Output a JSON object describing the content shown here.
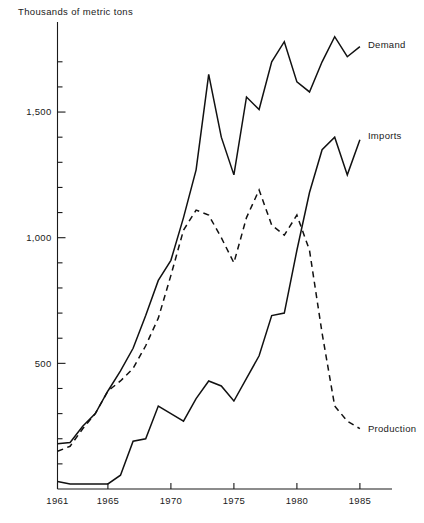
{
  "chart_data": {
    "type": "line",
    "title": "",
    "ylabel": "Thousands of metric tons",
    "xlabel": "",
    "xlim": [
      1961,
      1986.5
    ],
    "ylim": [
      0,
      1800
    ],
    "grid": false,
    "legend_position": "inline-right-end-of-line",
    "y_major_ticks": [
      500,
      1000,
      1500
    ],
    "y_major_tick_labels": [
      "500",
      "1,000",
      "1,500"
    ],
    "y_minor_tick_step": 100,
    "x_ticks": [
      1961,
      1965,
      1970,
      1975,
      1980,
      1985
    ],
    "x_tick_labels": [
      "1961",
      "1965",
      "1970",
      "1975",
      "1980",
      "1985"
    ],
    "x": [
      1961,
      1962,
      1963,
      1964,
      1965,
      1966,
      1967,
      1968,
      1969,
      1970,
      1971,
      1972,
      1973,
      1974,
      1975,
      1976,
      1977,
      1978,
      1979,
      1980,
      1981,
      1982,
      1983,
      1984,
      1985
    ],
    "series": [
      {
        "name": "Demand",
        "style": "solid",
        "values": [
          180,
          185,
          250,
          300,
          390,
          470,
          560,
          690,
          830,
          910,
          1080,
          1270,
          1650,
          1400,
          1250,
          1560,
          1510,
          1700,
          1780,
          1620,
          1580,
          1700,
          1800,
          1720,
          1760
        ]
      },
      {
        "name": "Imports",
        "style": "solid",
        "values": [
          30,
          20,
          20,
          20,
          20,
          55,
          190,
          200,
          330,
          300,
          270,
          360,
          430,
          410,
          350,
          440,
          530,
          690,
          700,
          950,
          1180,
          1350,
          1400,
          1250,
          1390
        ]
      },
      {
        "name": "Production",
        "style": "dashed",
        "values": [
          150,
          170,
          240,
          300,
          390,
          430,
          480,
          570,
          680,
          850,
          1030,
          1110,
          1090,
          1000,
          900,
          1080,
          1190,
          1050,
          1010,
          1090,
          950,
          620,
          330,
          270,
          240
        ]
      }
    ]
  },
  "labels": {
    "demand": "Demand",
    "imports": "Imports",
    "production": "Production",
    "y_axis_title": "Thousands of metric tons"
  }
}
